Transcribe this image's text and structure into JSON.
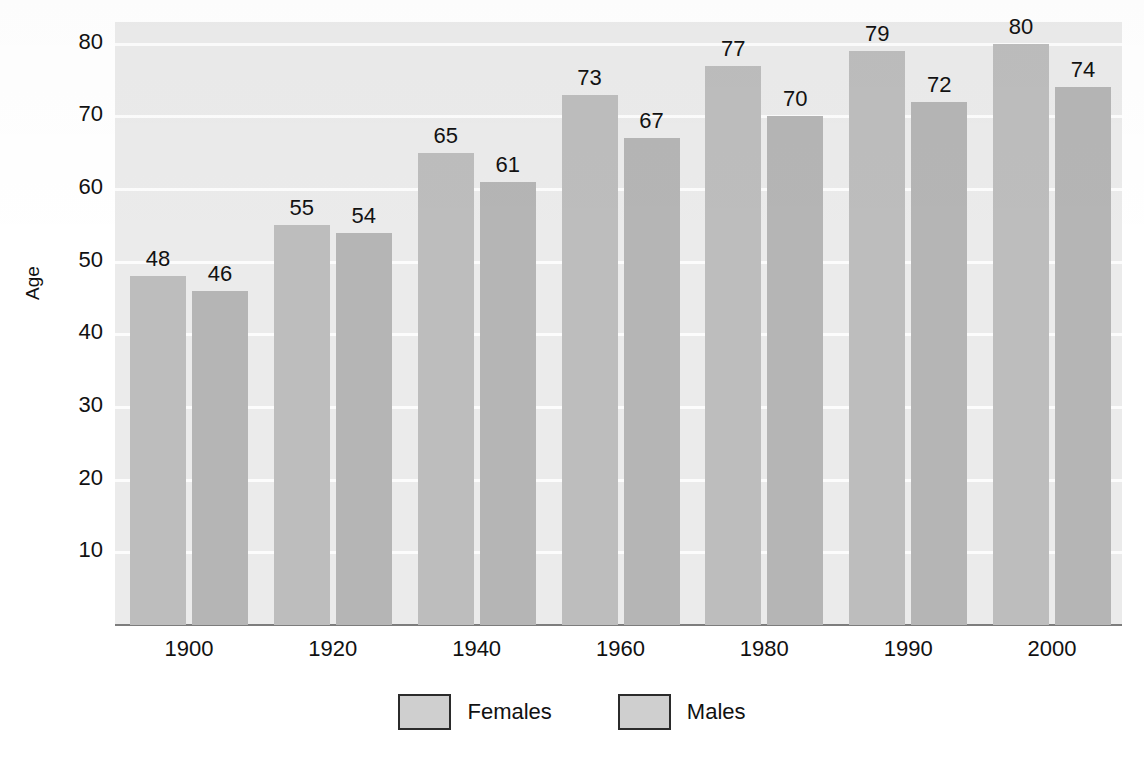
{
  "chart_data": {
    "type": "bar",
    "title": "",
    "subtitle": "",
    "xlabel": "",
    "ylabel": "Age",
    "categories": [
      "1900",
      "1920",
      "1940",
      "1960",
      "1980",
      "1990",
      "2000"
    ],
    "series": [
      {
        "name": "Females",
        "values": [
          48,
          55,
          65,
          73,
          77,
          79,
          80
        ],
        "color": "#bdbdbd"
      },
      {
        "name": "Males",
        "values": [
          46,
          54,
          61,
          67,
          70,
          72,
          74
        ],
        "color": "#b5b5b5"
      }
    ],
    "ylim": [
      0,
      83
    ],
    "yticks": [
      10,
      20,
      30,
      40,
      50,
      60,
      70,
      80
    ],
    "ytick_labels": [
      "10",
      "20",
      "30",
      "40",
      "50",
      "60",
      "70",
      "80"
    ],
    "grid": true,
    "grid_color": "#fcfcfc",
    "plot_background": "#ebebeb",
    "page_background": "#ffffff",
    "legend_position": "bottom",
    "data_labels": true,
    "annotations": []
  },
  "axes": {
    "y_title": "Age"
  },
  "legend": {
    "items": [
      {
        "label": "Females",
        "swatch_color": "#cfcfcf"
      },
      {
        "label": "Males",
        "swatch_color": "#cfcfcf"
      }
    ]
  }
}
